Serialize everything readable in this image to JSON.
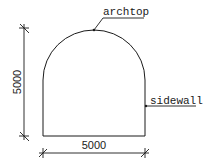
{
  "diagram": {
    "type": "tunnel-cross-section",
    "shape": "arch-top with vertical sidewalls",
    "labels": {
      "archtop": "archtop",
      "sidewall": "sidewall"
    },
    "dimensions": {
      "height": "5000",
      "width": "5000"
    },
    "colors": {
      "line": "#1a1a1a",
      "background": "#ffffff"
    }
  }
}
